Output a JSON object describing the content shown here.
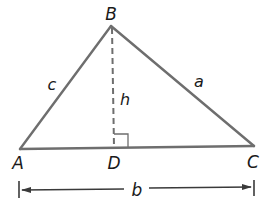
{
  "diagram": {
    "title": "",
    "vertices": {
      "A": {
        "label": "A",
        "x": 20,
        "y": 149
      },
      "B": {
        "label": "B",
        "x": 111,
        "y": 26
      },
      "C": {
        "label": "C",
        "x": 254,
        "y": 146
      },
      "D": {
        "label": "D",
        "x": 114,
        "y": 148
      }
    },
    "sides": {
      "a": {
        "label": "a",
        "from": "B",
        "to": "C"
      },
      "b": {
        "label": "b",
        "from": "A",
        "to": "C"
      },
      "c": {
        "label": "c",
        "from": "A",
        "to": "B"
      },
      "h": {
        "label": "h",
        "from": "B",
        "to": "D",
        "style": "dashed"
      }
    },
    "right_angle_marker": "D",
    "dimension_line": {
      "label": "b",
      "from_x": 19,
      "to_x": 254,
      "y": 190
    },
    "colors": {
      "stroke": "#6e6e6e",
      "text": "#1a1a1a",
      "background": "#ffffff"
    }
  }
}
